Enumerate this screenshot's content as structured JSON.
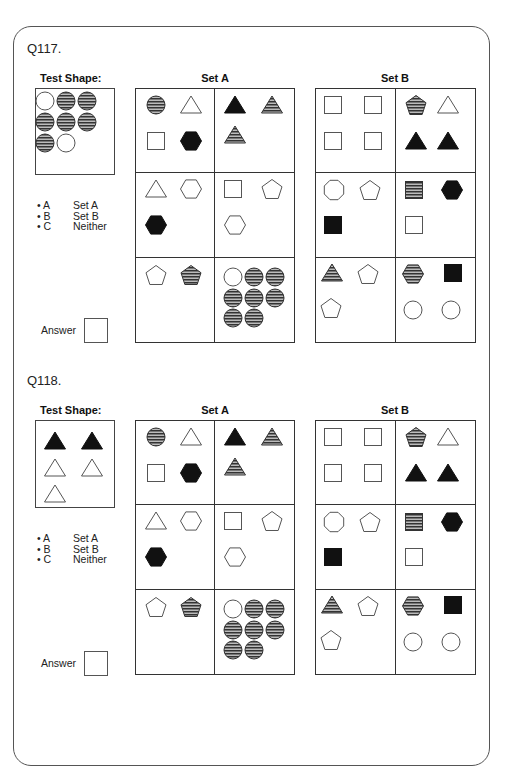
{
  "colors": {
    "stroke": "#555555",
    "solid": "#111111",
    "stripe": "#333333",
    "stripe_bg": "#bbbbbb"
  },
  "questions": [
    {
      "id": "q117",
      "title": "Q117.",
      "test_shape_label": "Test Shape:",
      "test_shape": [
        {
          "shape": "circle",
          "fill": "outline",
          "x": 9,
          "y": 12
        },
        {
          "shape": "circle",
          "fill": "striped",
          "x": 30,
          "y": 12
        },
        {
          "shape": "circle",
          "fill": "striped",
          "x": 51,
          "y": 12
        },
        {
          "shape": "circle",
          "fill": "striped",
          "x": 9,
          "y": 33
        },
        {
          "shape": "circle",
          "fill": "striped",
          "x": 30,
          "y": 33
        },
        {
          "shape": "circle",
          "fill": "striped",
          "x": 51,
          "y": 33
        },
        {
          "shape": "circle",
          "fill": "striped",
          "x": 9,
          "y": 54
        },
        {
          "shape": "circle",
          "fill": "outline",
          "x": 30,
          "y": 54
        }
      ],
      "options": [
        {
          "key": "• A",
          "label": "Set A"
        },
        {
          "key": "• B",
          "label": "Set B"
        },
        {
          "key": "• C",
          "label": "Neither"
        }
      ],
      "answer_label": "Answer",
      "answer_value": ""
    },
    {
      "id": "q118",
      "title": "Q118.",
      "test_shape_label": "Test Shape:",
      "test_shape": [
        {
          "shape": "triangle",
          "fill": "solid",
          "x": 19,
          "y": 20
        },
        {
          "shape": "triangle",
          "fill": "solid",
          "x": 56,
          "y": 20
        },
        {
          "shape": "triangle",
          "fill": "outline",
          "x": 19,
          "y": 47
        },
        {
          "shape": "triangle",
          "fill": "outline",
          "x": 56,
          "y": 47
        },
        {
          "shape": "triangle",
          "fill": "outline",
          "x": 19,
          "y": 73
        }
      ],
      "options": [
        {
          "key": "• A",
          "label": "Set A"
        },
        {
          "key": "• B",
          "label": "Set B"
        },
        {
          "key": "• C",
          "label": "Neither"
        }
      ],
      "answer_label": "Answer",
      "answer_value": ""
    }
  ],
  "set_a": {
    "label": "Set A",
    "cells": [
      [
        {
          "shape": "circle",
          "fill": "striped",
          "x": 20,
          "y": 16
        },
        {
          "shape": "triangle",
          "fill": "outline",
          "x": 55,
          "y": 16
        },
        {
          "shape": "square",
          "fill": "outline",
          "x": 20,
          "y": 52
        },
        {
          "shape": "hexagon",
          "fill": "solid",
          "x": 55,
          "y": 52
        }
      ],
      [
        {
          "shape": "triangle",
          "fill": "solid",
          "x": 20,
          "y": 16
        },
        {
          "shape": "triangle",
          "fill": "striped",
          "x": 57,
          "y": 16
        },
        {
          "shape": "triangle",
          "fill": "striped",
          "x": 20,
          "y": 46
        }
      ],
      [
        {
          "shape": "triangle",
          "fill": "outline",
          "x": 20,
          "y": 16
        },
        {
          "shape": "hexagon",
          "fill": "outline",
          "x": 55,
          "y": 16
        },
        {
          "shape": "hexagon",
          "fill": "solid",
          "x": 20,
          "y": 52
        }
      ],
      [
        {
          "shape": "square",
          "fill": "outline",
          "x": 18,
          "y": 16
        },
        {
          "shape": "pentagon",
          "fill": "outline",
          "x": 57,
          "y": 16
        },
        {
          "shape": "hexagon",
          "fill": "outline",
          "x": 20,
          "y": 52
        }
      ],
      [
        {
          "shape": "pentagon",
          "fill": "outline",
          "x": 20,
          "y": 17
        },
        {
          "shape": "pentagon",
          "fill": "striped",
          "x": 55,
          "y": 17
        }
      ],
      [
        {
          "shape": "circle",
          "fill": "outline",
          "x": 18,
          "y": 19
        },
        {
          "shape": "circle",
          "fill": "striped",
          "x": 39,
          "y": 19
        },
        {
          "shape": "circle",
          "fill": "striped",
          "x": 60,
          "y": 19
        },
        {
          "shape": "circle",
          "fill": "striped",
          "x": 18,
          "y": 40
        },
        {
          "shape": "circle",
          "fill": "striped",
          "x": 39,
          "y": 40
        },
        {
          "shape": "circle",
          "fill": "striped",
          "x": 60,
          "y": 40
        },
        {
          "shape": "circle",
          "fill": "striped",
          "x": 18,
          "y": 60
        },
        {
          "shape": "circle",
          "fill": "striped",
          "x": 39,
          "y": 60
        }
      ]
    ]
  },
  "set_b": {
    "label": "Set B",
    "cells": [
      [
        {
          "shape": "square",
          "fill": "outline",
          "x": 17,
          "y": 16
        },
        {
          "shape": "square",
          "fill": "outline",
          "x": 57,
          "y": 16
        },
        {
          "shape": "square",
          "fill": "outline",
          "x": 17,
          "y": 52
        },
        {
          "shape": "square",
          "fill": "outline",
          "x": 57,
          "y": 52
        }
      ],
      [
        {
          "shape": "pentagon",
          "fill": "striped",
          "x": 20,
          "y": 16
        },
        {
          "shape": "triangle",
          "fill": "outline",
          "x": 52,
          "y": 16
        },
        {
          "shape": "triangle",
          "fill": "solid",
          "x": 20,
          "y": 52
        },
        {
          "shape": "triangle",
          "fill": "solid",
          "x": 52,
          "y": 52
        }
      ],
      [
        {
          "shape": "octagon",
          "fill": "outline",
          "x": 18,
          "y": 17
        },
        {
          "shape": "pentagon",
          "fill": "outline",
          "x": 54,
          "y": 17
        },
        {
          "shape": "square",
          "fill": "solid",
          "x": 17,
          "y": 52
        }
      ],
      [
        {
          "shape": "square",
          "fill": "striped",
          "x": 18,
          "y": 17
        },
        {
          "shape": "hexagon",
          "fill": "solid",
          "x": 56,
          "y": 17
        },
        {
          "shape": "square",
          "fill": "outline",
          "x": 18,
          "y": 52
        }
      ],
      [
        {
          "shape": "triangle",
          "fill": "striped",
          "x": 16,
          "y": 15
        },
        {
          "shape": "pentagon",
          "fill": "outline",
          "x": 52,
          "y": 16
        },
        {
          "shape": "pentagon",
          "fill": "outline",
          "x": 15,
          "y": 50
        }
      ],
      [
        {
          "shape": "hexagon",
          "fill": "striped",
          "x": 17,
          "y": 16
        },
        {
          "shape": "square",
          "fill": "solid",
          "x": 57,
          "y": 15
        },
        {
          "shape": "circle",
          "fill": "outline",
          "x": 17,
          "y": 52
        },
        {
          "shape": "circle",
          "fill": "outline",
          "x": 55,
          "y": 52
        }
      ]
    ]
  }
}
